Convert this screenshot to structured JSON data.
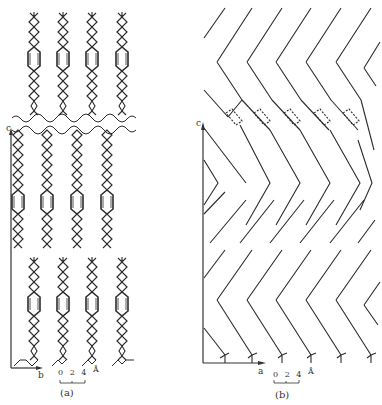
{
  "figure": {
    "panels": [
      {
        "id": "a",
        "caption": "(a)",
        "axis_vertical_label": "c",
        "axis_horizontal_label": "b",
        "scale_bar": {
          "ticks": "0 2 4",
          "unit": "Å"
        },
        "molecule_columns": 4,
        "molecule_rows": 3,
        "description": "Crystal packing projection along a: rod-like molecules with zigzag chains and central phenylene ring, layered along c"
      },
      {
        "id": "b",
        "caption": "(b)",
        "axis_vertical_label": "c",
        "axis_horizontal_label": "a",
        "scale_bar": {
          "ticks": "0 2 4",
          "unit": "Å"
        },
        "molecule_columns": 6,
        "description": "Crystal packing projection along b: chevron-shaped (bent) molecules with dashed ring outlines, layered along c"
      }
    ],
    "line_color": "#2b2b2b"
  }
}
